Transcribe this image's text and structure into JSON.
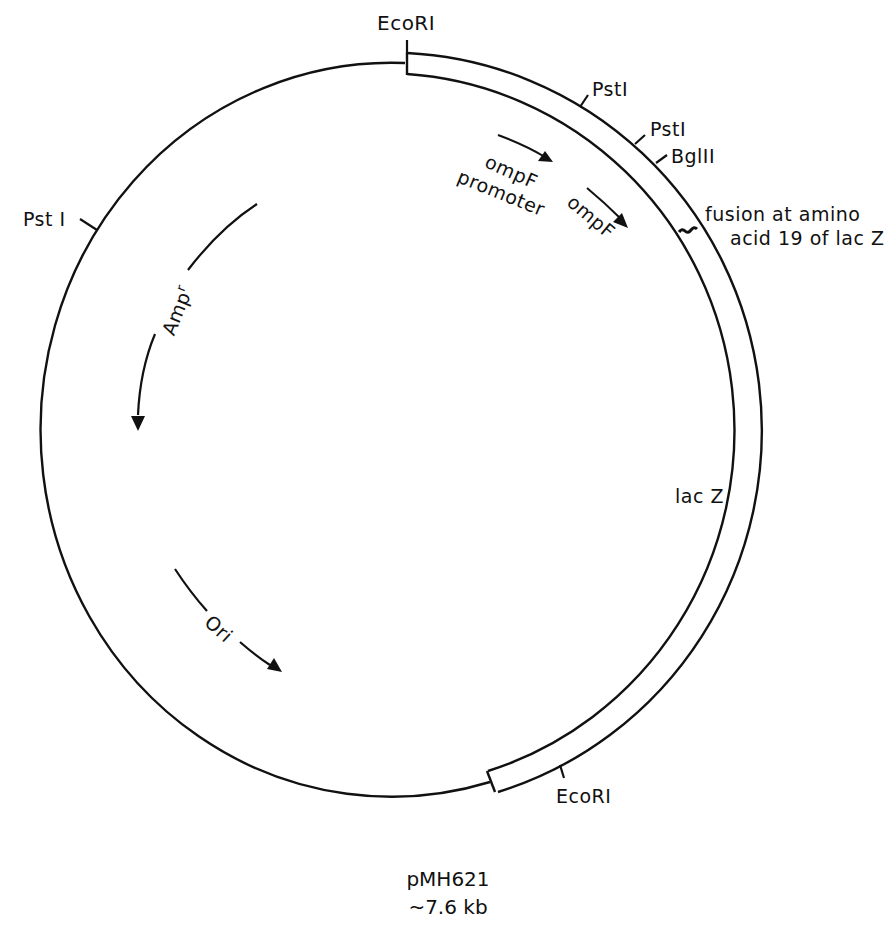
{
  "plasmid": {
    "name": "pMH621",
    "size": "~7.6 kb"
  },
  "restriction_sites": [
    {
      "label": "EcoRI",
      "position": "top"
    },
    {
      "label": "PstI",
      "position": "upper-right-1"
    },
    {
      "label": "PstI",
      "position": "upper-right-2"
    },
    {
      "label": "BglII",
      "position": "upper-right-3"
    },
    {
      "label": "PstI",
      "position": "left"
    },
    {
      "label": "EcoRI",
      "position": "bottom"
    }
  ],
  "features": {
    "ompf_promoter": "ompF\npromoter",
    "ompf_promoter_line1": "ompF",
    "ompf_promoter_line2": "promoter",
    "ompf": "ompF",
    "fusion_line1": "fusion at amino",
    "fusion_line2": "acid 19 of lac Z",
    "lacz": "lac Z",
    "ampr": "Amp",
    "ampr_sup": "r",
    "ori": "Ori"
  },
  "labels": {
    "ecori_top": "EcoRI",
    "psti_1": "PstI",
    "psti_2": "PstI",
    "bglii": "BglII",
    "psti_left": "Pst I",
    "ecori_bottom": "EcoRI"
  },
  "colors": {
    "ink": "#111111",
    "background": "#ffffff"
  }
}
